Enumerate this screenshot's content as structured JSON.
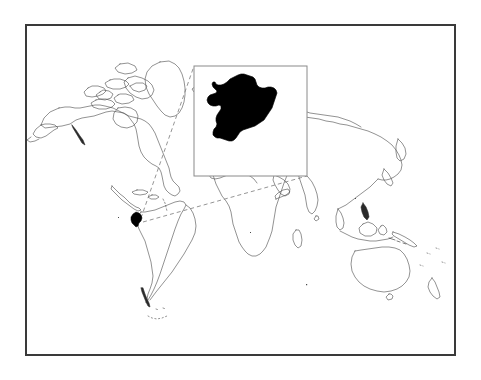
{
  "figure": {
    "type": "locator-map",
    "title": "",
    "caption": "",
    "background_color": "#ffffff",
    "frame": {
      "name": "figure-border",
      "x": 25,
      "y": 24,
      "width": 431,
      "height": 332,
      "stroke_color": "#3a3a3a",
      "stroke_width": 2,
      "fill_color": "#ffffff"
    }
  },
  "world_map": {
    "name": "world-outline-map",
    "projection": "equirectangular",
    "coastline_color": "#4a4a4a",
    "coastline_width": 0.6,
    "land_fill": "#ffffff",
    "ocean_fill": "#ffffff",
    "lon_range": [
      -180,
      180
    ],
    "lat_range": [
      -90,
      90
    ],
    "plot_box": {
      "x": 27,
      "y": 26,
      "width": 427,
      "height": 328
    },
    "graticule": "off",
    "labels": []
  },
  "highlight": {
    "name": "highlighted-country",
    "label": "",
    "fill_color": "#000000",
    "stroke_color": "#000000",
    "center_lon": -78.5,
    "center_lat": -1.5,
    "marker_box": {
      "x": 131,
      "y": 212,
      "width": 12,
      "height": 15
    }
  },
  "inset": {
    "name": "inset-detail-panel",
    "title": "",
    "box": {
      "x": 194,
      "y": 66,
      "width": 113,
      "height": 110
    },
    "border_color": "#8a8a8a",
    "border_width": 1,
    "background_color": "#ffffff",
    "shape_fill": "#000000",
    "shape_label": ""
  },
  "leader_lines": {
    "name": "inset-leader-lines",
    "style": "dashed",
    "color": "#7a7a7a",
    "width": 0.8,
    "dash_pattern": "4 3",
    "lines": [
      {
        "name": "leader-upper",
        "from": [
          141,
          218
        ],
        "to": [
          194,
          66
        ]
      },
      {
        "name": "leader-lower",
        "from": [
          143,
          222
        ],
        "to": [
          307,
          176
        ]
      }
    ]
  },
  "colors": {
    "frame": "#3a3a3a",
    "coastline": "#4a4a4a",
    "highlight": "#000000",
    "inset_border": "#8a8a8a",
    "leader": "#7a7a7a",
    "background": "#ffffff"
  }
}
